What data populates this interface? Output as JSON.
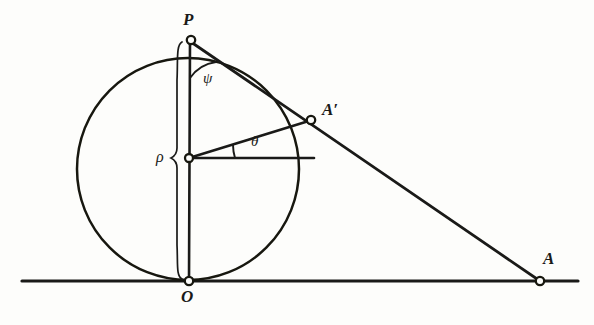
{
  "figure": {
    "kind": "geometry-diagram",
    "background_color": "#fdfdfb",
    "ink_color": "#1a1a18",
    "labels": {
      "point_p": "P",
      "point_a_prime": "A′",
      "point_a": "A",
      "point_o": "O",
      "angle_psi": "ψ",
      "angle_theta": "θ",
      "radius_rho": "ρ"
    },
    "geometry": {
      "baseline": {
        "x1": 22,
        "y1": 281,
        "x2": 578,
        "y2": 281
      },
      "circle": {
        "cx": 188,
        "cy": 169,
        "r": 111
      },
      "points": {
        "P": {
          "x": 190,
          "y": 40
        },
        "center": {
          "x": 188,
          "y": 158
        },
        "A_prime": {
          "x": 311,
          "y": 120
        },
        "A": {
          "x": 540,
          "y": 281
        },
        "O": {
          "x": 188,
          "y": 280
        }
      },
      "segments": [
        {
          "name": "diameter-PO",
          "from": "P",
          "to": "O"
        },
        {
          "name": "chord-P-Aprime",
          "from": "P",
          "to": "A_prime"
        },
        {
          "name": "radius-center-Aprime",
          "from": "center",
          "to": "A_prime"
        },
        {
          "name": "horizontal-from-center",
          "from": "center",
          "to": "circle-right"
        },
        {
          "name": "secant-P-A",
          "from": "P",
          "to": "A"
        }
      ],
      "arcs": [
        {
          "name": "angle-psi-arc",
          "vertex": "P",
          "label": "ψ"
        },
        {
          "name": "angle-theta-arc",
          "vertex": "center",
          "label": "θ"
        }
      ],
      "brace": {
        "name": "rho-brace",
        "x": 176,
        "top": 42,
        "bottom": 279,
        "tip_y": 158
      }
    }
  }
}
